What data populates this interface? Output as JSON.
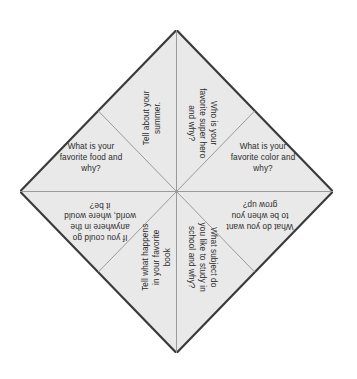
{
  "document": {
    "title": "Conversation Starter Cootie Catcher",
    "shape": "diamond",
    "section_count": 8
  },
  "style": {
    "fill_color": "#e9e9e9",
    "outer_border_color": "#3a3a3a",
    "fold_line_color": "#9a9a9a",
    "text_color": "#2b2b2b",
    "background_color": "#ffffff"
  },
  "sections": [
    {
      "id": "top-left",
      "position": "upper-left-inner",
      "rotation_deg": -90,
      "text": "Tell about your\nsummer."
    },
    {
      "id": "top-right",
      "position": "upper-right-inner",
      "rotation_deg": 90,
      "text": "Who is your\nfavorite super hero\nand why?"
    },
    {
      "id": "left-mid",
      "position": "upper-left-outer",
      "rotation_deg": 0,
      "text": "What is your\nfavorite food and\nwhy?"
    },
    {
      "id": "right-mid",
      "position": "upper-right-outer",
      "rotation_deg": 0,
      "text": "What is your\nfavorite color and\nwhy?"
    },
    {
      "id": "left-low",
      "position": "lower-left-outer",
      "rotation_deg": 180,
      "text": "If you could go\nanywhere in the\nworld, where would\nit be?"
    },
    {
      "id": "right-low",
      "position": "lower-right-outer",
      "rotation_deg": 180,
      "text": "What do you want\nto be when you\ngrow up?"
    },
    {
      "id": "bot-left",
      "position": "lower-left-inner",
      "rotation_deg": -90,
      "text": "Tell what happens\nin your favorite\nbook"
    },
    {
      "id": "bot-right",
      "position": "lower-right-inner",
      "rotation_deg": 90,
      "text": "What subject do\nyou like to study in\nschool and why?"
    }
  ]
}
